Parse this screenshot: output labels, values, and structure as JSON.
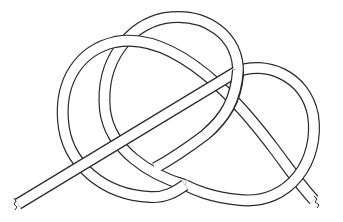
{
  "figure": {
    "colors": {
      "line": "#2a2a2a",
      "background": "#ffffff"
    }
  }
}
